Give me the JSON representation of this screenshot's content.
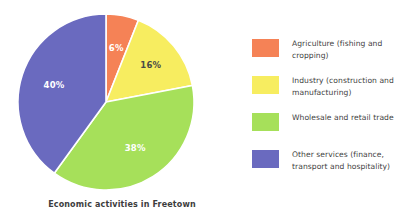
{
  "chart_data": {
    "type": "pie",
    "title": "Economic activities in Freetown",
    "categories": [
      "Agriculture (fishing and cropping)",
      "Industry (construction and manufacturing)",
      "Wholesale and retail trade",
      "Other services (finance, transport and hospitality)"
    ],
    "values": [
      6,
      16,
      38,
      40
    ],
    "value_labels": [
      "6%",
      "16%",
      "38%",
      "40%"
    ],
    "colors": [
      "#F58256",
      "#F7ED60",
      "#A6E05A",
      "#6A6ABF"
    ],
    "label_colors": [
      "#ffffff",
      "#4a4a46",
      "#ffffff",
      "#ffffff"
    ],
    "units": "percent",
    "start_angle_deg": 0,
    "direction": "clockwise",
    "legend_position": "right",
    "grid": false,
    "xlabel": "",
    "ylabel": ""
  },
  "caption": {
    "text": "Economic activities in Freetown"
  },
  "legend": {
    "items": [
      {
        "label": "Agriculture (fishing and cropping)",
        "color": "#F58256",
        "percent": "6%"
      },
      {
        "label": "Industry (construction and manufacturing)",
        "color": "#F7ED60",
        "percent": "16%"
      },
      {
        "label": "Wholesale and retail trade",
        "color": "#A6E05A",
        "percent": "38%"
      },
      {
        "label": "Other services (finance, transport and hospitality)",
        "color": "#6A6ABF",
        "percent": "40%"
      }
    ]
  },
  "slice_labels": {
    "agriculture": "6%",
    "industry": "16%",
    "wholesale": "38%",
    "other_services": "40%"
  }
}
